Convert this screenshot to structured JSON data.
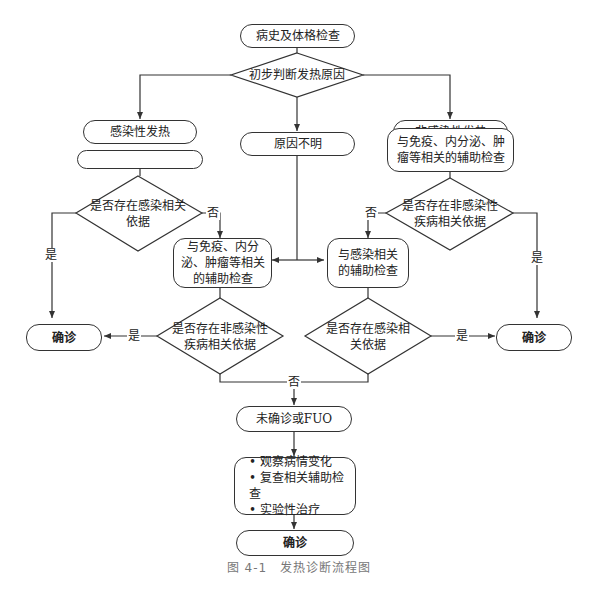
{
  "diagram": {
    "start": "病史及体格检查",
    "decision_initial": "初步判断发热原因",
    "branch_infectious": "感染性发热",
    "branch_unknown": "原因不明",
    "branch_noninfectious": "非感染性发热",
    "infect_exam": "与感染相关的辅助检查",
    "noninfect_exam": "与免疫、内分泌、肿瘤等相关的辅助检查",
    "infect_decision": "是否存在感染相关依据",
    "noninfect_decision": "是否存在非感染性疾病相关依据",
    "cross_noninfect_exam": "与免疫、内分泌、肿瘤等相关的辅助检查",
    "cross_infect_exam": "与感染相关的辅助检查",
    "cross_noninfect_decision": "是否存在非感染性疾病相关依据",
    "cross_infect_decision": "是否存在感染相关依据",
    "confirm_left": "确诊",
    "confirm_right": "确诊",
    "unconfirmed": "未确诊或FUO",
    "actions": [
      "观察病情变化",
      "复查相关辅助检查",
      "实验性治疗"
    ],
    "confirm_final": "确诊",
    "labels": {
      "yes": "是",
      "no": "否"
    }
  },
  "caption": "图 4-1　发热诊断流程图"
}
